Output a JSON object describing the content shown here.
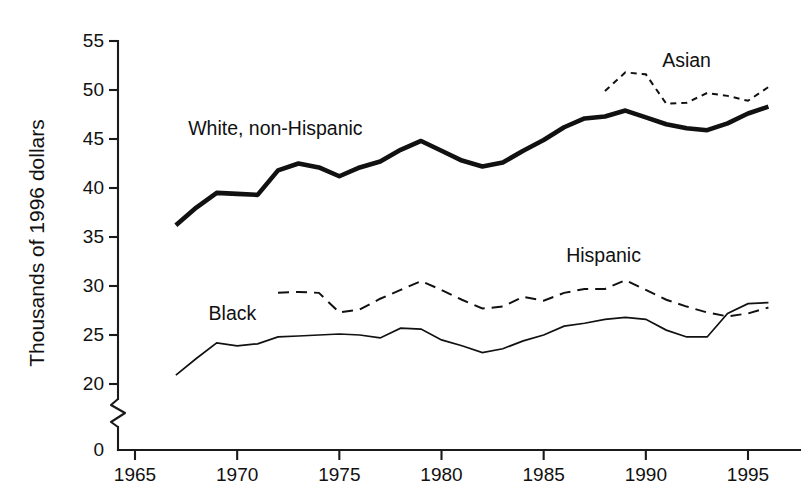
{
  "chart_data": {
    "type": "line",
    "title": "",
    "xlabel": "",
    "ylabel": "Thousands of 1996 dollars",
    "xlim": [
      1964,
      1996.5
    ],
    "ylim": [
      19.2,
      55.8
    ],
    "y_axis_broken": true,
    "y_break_label": "0",
    "grid": false,
    "legend_position": "inline-annotations",
    "xticks": [
      1965,
      1970,
      1975,
      1980,
      1985,
      1990,
      1995
    ],
    "xtick_labels": [
      "1965",
      "1970",
      "1975",
      "1980",
      "1985",
      "1990",
      "1995"
    ],
    "yticks": [
      20,
      25,
      30,
      35,
      40,
      45,
      50,
      55
    ],
    "ytick_labels": [
      "20",
      "25",
      "30",
      "35",
      "40",
      "45",
      "50",
      "55"
    ],
    "series": [
      {
        "name": "White, non-Hispanic",
        "style": "thick-solid",
        "label_x": 1967.6,
        "label_y": 45.4,
        "x": [
          1967,
          1968,
          1969,
          1970,
          1971,
          1972,
          1973,
          1974,
          1975,
          1976,
          1977,
          1978,
          1979,
          1980,
          1981,
          1982,
          1983,
          1984,
          1985,
          1986,
          1987,
          1988,
          1989,
          1990,
          1991,
          1992,
          1993,
          1994,
          1995,
          1996
        ],
        "y": [
          36.2,
          38.0,
          39.5,
          39.4,
          39.3,
          41.8,
          42.5,
          42.1,
          41.2,
          42.1,
          42.7,
          43.9,
          44.8,
          43.8,
          42.8,
          42.2,
          42.6,
          43.8,
          44.9,
          46.2,
          47.1,
          47.3,
          47.9,
          47.2,
          46.5,
          46.1,
          45.9,
          46.6,
          47.6,
          48.3
        ]
      },
      {
        "name": "Black",
        "style": "thin-solid",
        "label_x": 1968.6,
        "label_y": 26.5,
        "x": [
          1967,
          1968,
          1969,
          1970,
          1971,
          1972,
          1973,
          1974,
          1975,
          1976,
          1977,
          1978,
          1979,
          1980,
          1981,
          1982,
          1983,
          1984,
          1985,
          1986,
          1987,
          1988,
          1989,
          1990,
          1991,
          1992,
          1993,
          1994,
          1995,
          1996
        ],
        "y": [
          20.9,
          22.6,
          24.2,
          23.9,
          24.1,
          24.8,
          24.9,
          25.0,
          25.1,
          25.0,
          24.7,
          25.7,
          25.6,
          24.5,
          23.9,
          23.2,
          23.6,
          24.4,
          25.0,
          25.9,
          26.2,
          26.6,
          26.8,
          26.6,
          25.5,
          24.8,
          24.8,
          27.2,
          28.2,
          28.3
        ]
      },
      {
        "name": "Hispanic",
        "style": "dashed",
        "label_x": 1986.1,
        "label_y": 32.4,
        "x": [
          1972,
          1973,
          1974,
          1975,
          1976,
          1977,
          1978,
          1979,
          1980,
          1981,
          1982,
          1983,
          1984,
          1985,
          1986,
          1987,
          1988,
          1989,
          1990,
          1991,
          1992,
          1993,
          1994,
          1995,
          1996
        ],
        "y": [
          29.3,
          29.4,
          29.3,
          27.3,
          27.6,
          28.7,
          29.6,
          30.5,
          29.6,
          28.6,
          27.7,
          27.9,
          28.9,
          28.5,
          29.3,
          29.7,
          29.7,
          30.6,
          29.6,
          28.6,
          27.9,
          27.3,
          26.9,
          27.2,
          27.8
        ]
      },
      {
        "name": "Asian",
        "style": "dotted-dashed",
        "label_x": 1990.8,
        "label_y": 52.3,
        "x": [
          1988,
          1989,
          1990,
          1991,
          1992,
          1993,
          1994,
          1995,
          1996
        ],
        "y": [
          49.9,
          51.8,
          51.6,
          48.6,
          48.7,
          49.7,
          49.4,
          48.9,
          50.3
        ]
      }
    ]
  },
  "axis": {
    "y_title": "Thousands of 1996 dollars",
    "zero_label": "0"
  },
  "labels": {
    "white": "White, non-Hispanic",
    "black": "Black",
    "hispanic": "Hispanic",
    "asian": "Asian"
  }
}
